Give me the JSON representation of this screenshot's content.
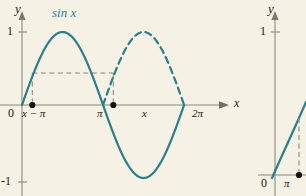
{
  "figure": {
    "background_color": "#f5f1e4",
    "curve_color": "#2b7f8c",
    "axis_color": "#8a8a80",
    "dash_color": "#8a8a80",
    "point_color": "#111111",
    "label_color": "#1a1a1a"
  },
  "left_panel": {
    "name": "sine-graph-panel",
    "y_axis_label": "y",
    "x_axis_label": "x",
    "curve_label": "sin x",
    "y_ticks": [
      {
        "label": "1",
        "value": 1
      },
      {
        "label": "-1",
        "value": -1
      }
    ],
    "origin_label": "0",
    "x_ticks": [
      {
        "label": "π",
        "value": 3.14159
      },
      {
        "label": "2π",
        "value": 6.28319
      }
    ],
    "marked_points": [
      {
        "label": "x − π",
        "x_value": 0.4
      },
      {
        "label": "x",
        "x_value": 3.54
      }
    ],
    "dashed_guides": "horizontal line at y = sin(x-π) joining the two marked abscissas, with vertical drops to the axis"
  },
  "right_panel": {
    "name": "second-graph-panel",
    "y_axis_label": "y",
    "y_ticks": [
      {
        "label": "1",
        "value": 1
      }
    ],
    "origin_label": "0",
    "x_ticks": [
      {
        "label": "π",
        "value": 3.14159
      }
    ]
  },
  "chart_data": {
    "type": "line",
    "title": "",
    "xlabel": "x",
    "ylabel": "y",
    "xlim": [
      0,
      7.1
    ],
    "ylim": [
      -1.25,
      1.25
    ],
    "grid": false,
    "legend": "none",
    "series": [
      {
        "name": "sin x (solid)",
        "style": "solid",
        "color": "#2b7f8c",
        "x": [
          0,
          0.3927,
          0.7854,
          1.1781,
          1.5708,
          1.9635,
          2.3562,
          2.7489,
          3.1416,
          3.5343,
          3.927,
          4.3197,
          4.7124,
          5.1051,
          5.4978,
          5.8905,
          6.2832
        ],
        "y": [
          0,
          0.3827,
          0.7071,
          0.9239,
          1,
          0.9239,
          0.7071,
          0.3827,
          0,
          -0.3827,
          -0.7071,
          -0.9239,
          -1,
          -0.9239,
          -0.7071,
          -0.3827,
          0
        ]
      },
      {
        "name": "|sin x| second arch (dashed)",
        "style": "dashed",
        "color": "#2b7f8c",
        "x": [
          3.1416,
          3.5343,
          3.927,
          4.3197,
          4.7124,
          5.1051,
          5.4978,
          5.8905,
          6.2832
        ],
        "y": [
          0,
          0.3827,
          0.7071,
          0.9239,
          1,
          0.9239,
          0.7071,
          0.3827,
          0
        ]
      }
    ],
    "annotations": [
      {
        "text": "sin x",
        "x": 1.25,
        "y": 1.18
      },
      {
        "text": "x − π",
        "x": 0.4,
        "y": -0.13,
        "marker": true
      },
      {
        "text": "x",
        "x": 3.54,
        "y": -0.13,
        "marker": true
      },
      {
        "text": "π",
        "x": 3.1416,
        "y": -0.13
      },
      {
        "text": "2π",
        "x": 6.2832,
        "y": -0.13
      }
    ],
    "guides": {
      "horizontal_y": 0.4382,
      "vertical_x": [
        0.4,
        3.54
      ]
    }
  }
}
